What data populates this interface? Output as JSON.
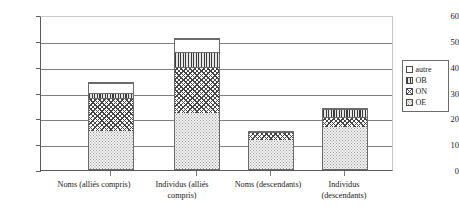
{
  "chart_data": {
    "type": "bar",
    "stacked": true,
    "title": "",
    "xlabel": "",
    "ylabel": "",
    "ylim": [
      0,
      60
    ],
    "ytick_labels": [
      "0",
      "10",
      "20",
      "30",
      "40",
      "50",
      "60"
    ],
    "yticks": [
      0,
      10,
      20,
      30,
      40,
      50,
      60
    ],
    "grid": true,
    "legend_position": "right",
    "categories": [
      "Noms (alliés compris)",
      "Individus (alliés compris)",
      "Noms (descendants)",
      "Individus (descendants)"
    ],
    "series": [
      {
        "name": "OE",
        "values": [
          15,
          22,
          12,
          17
        ]
      },
      {
        "name": "ON",
        "values": [
          13,
          18,
          3,
          4
        ]
      },
      {
        "name": "OB",
        "values": [
          2,
          6,
          0,
          3
        ]
      },
      {
        "name": "autre",
        "values": [
          4,
          5,
          0,
          0
        ]
      }
    ],
    "totals": [
      34,
      51,
      15,
      24
    ]
  },
  "legend": {
    "entries": [
      {
        "label": "autre",
        "pattern": "autre"
      },
      {
        "label": "OB",
        "pattern": "OB"
      },
      {
        "label": "ON",
        "pattern": "ON"
      },
      {
        "label": "OE",
        "pattern": "OE"
      }
    ]
  },
  "axis": {
    "y_tick_0": "0",
    "y_tick_1": "10",
    "y_tick_2": "20",
    "y_tick_3": "30",
    "y_tick_4": "40",
    "y_tick_5": "50",
    "y_tick_6": "60"
  }
}
